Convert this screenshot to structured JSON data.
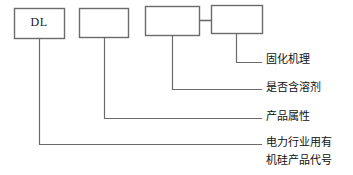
{
  "diagram": {
    "type": "product-code-breakdown",
    "stroke_color": "#6b6b6b",
    "text_color": "#101010",
    "background_color": "#ffffff",
    "boxes": [
      {
        "id": "box-dl",
        "label": "DL",
        "x": 14,
        "y": 8,
        "width": 50,
        "height": 30
      },
      {
        "id": "box-second",
        "label": "",
        "x": 79,
        "y": 8,
        "width": 49,
        "height": 29
      },
      {
        "id": "box-third",
        "label": "",
        "x": 145,
        "y": 6,
        "width": 54,
        "height": 29
      },
      {
        "id": "box-fourth",
        "label": "",
        "x": 211,
        "y": 5,
        "width": 51,
        "height": 28
      }
    ],
    "connector": {
      "name": "hyphen-connector",
      "x1": 199,
      "y1": 20,
      "x2": 211,
      "y2": 20
    },
    "leaders": [
      {
        "id": "leader-curing",
        "from_box": "box-fourth",
        "drop_x": 236,
        "drop_y": 62,
        "end_x": 262
      },
      {
        "id": "leader-solvent",
        "from_box": "box-third",
        "drop_x": 172,
        "drop_y": 89,
        "end_x": 262
      },
      {
        "id": "leader-attribute",
        "from_box": "box-second",
        "drop_x": 104,
        "drop_y": 118,
        "end_x": 262
      },
      {
        "id": "leader-code",
        "from_box": "box-dl",
        "drop_x": 39,
        "drop_y": 144,
        "end_x": 262
      }
    ],
    "labels": [
      {
        "id": "label-curing",
        "lines": [
          "固化机理"
        ],
        "x": 266,
        "y": 51
      },
      {
        "id": "label-solvent",
        "lines": [
          "是否含溶剂"
        ],
        "x": 266,
        "y": 79
      },
      {
        "id": "label-attribute",
        "lines": [
          "产品属性"
        ],
        "x": 266,
        "y": 108
      },
      {
        "id": "label-code",
        "lines": [
          "电力行业用有",
          "机硅产品代号"
        ],
        "x": 266,
        "y": 134
      }
    ]
  }
}
